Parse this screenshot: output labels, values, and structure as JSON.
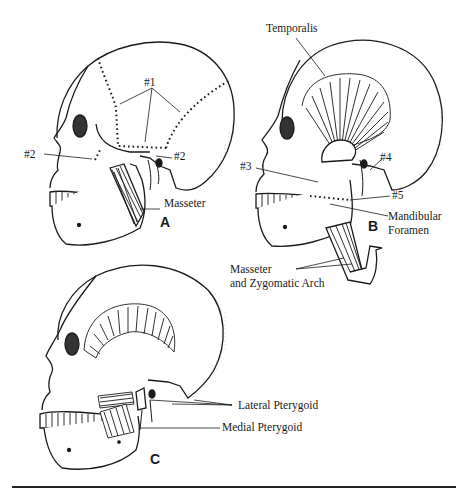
{
  "figure": {
    "panels": [
      {
        "id": "A",
        "label": "A",
        "annotations": {
          "n1": "#1",
          "n2_left": "#2",
          "n2_right": "#2",
          "masseter": "Masseter"
        }
      },
      {
        "id": "B",
        "label": "B",
        "annotations": {
          "temporalis": "Temporalis",
          "n3": "#3",
          "n4": "#4",
          "n5": "#5",
          "mandibular_foramen_1": "Mandibular",
          "mandibular_foramen_2": "Foramen",
          "masseter_arch_1": "Masseter",
          "masseter_arch_2": "and Zygomatic Arch"
        }
      },
      {
        "id": "C",
        "label": "C",
        "annotations": {
          "lateral_pterygoid": "Lateral Pterygoid",
          "medial_pterygoid": "Medial Pterygoid"
        }
      }
    ],
    "colors": {
      "ink": "#1a1a1a",
      "background": "#ffffff"
    }
  }
}
